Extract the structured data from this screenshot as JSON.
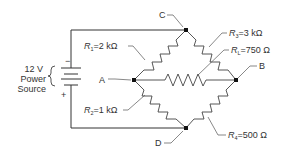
{
  "diagram": {
    "type": "Wheatstone bridge circuit",
    "source": {
      "voltage_label": "12 V",
      "line1": "Power",
      "line2": "Source",
      "minus": "−",
      "plus": "+"
    },
    "nodes": {
      "A": "A",
      "B": "B",
      "C": "C",
      "D": "D"
    },
    "resistors": [
      {
        "id": "R1",
        "symbol": "R",
        "subscript": "1",
        "value": "=2 kΩ"
      },
      {
        "id": "R2",
        "symbol": "R",
        "subscript": "2",
        "value": "=1 kΩ"
      },
      {
        "id": "R3",
        "symbol": "R",
        "subscript": "3",
        "value": "=3 kΩ"
      },
      {
        "id": "RL",
        "symbol": "R",
        "subscript": "L",
        "value": "=750 Ω"
      },
      {
        "id": "R4",
        "symbol": "R",
        "subscript": "4",
        "value": "=500 Ω"
      }
    ]
  }
}
